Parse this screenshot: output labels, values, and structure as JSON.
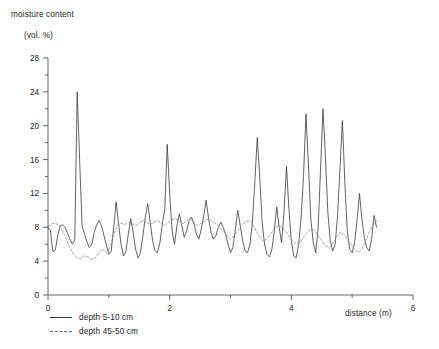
{
  "chart_data": {
    "type": "line",
    "title": "moisture content (vol. %)",
    "title_line1": "moisture content",
    "title_line2": "(vol. %)",
    "xlabel": "distance (m)",
    "ylabel": "moisture content (vol. %)",
    "xlim": [
      0,
      6
    ],
    "ylim": [
      0,
      28
    ],
    "xticks": [
      0,
      1,
      2,
      3,
      4,
      5,
      6
    ],
    "xtick_labels": [
      "0",
      "",
      "2",
      "",
      "4",
      "",
      "6"
    ],
    "yticks": [
      0,
      2,
      4,
      6,
      8,
      10,
      12,
      14,
      16,
      18,
      20,
      22,
      24,
      26,
      28
    ],
    "ytick_labels": [
      "0",
      "",
      "4",
      "",
      "8",
      "",
      "12",
      "",
      "16",
      "",
      "20",
      "",
      "24",
      "",
      "28"
    ],
    "grid": false,
    "legend_position": "below-axis-left",
    "series": [
      {
        "name": "depth 5-10 cm",
        "style": "solid",
        "color": "#3a3a3a",
        "x": [
          0.0,
          0.04,
          0.08,
          0.12,
          0.16,
          0.2,
          0.24,
          0.28,
          0.32,
          0.36,
          0.4,
          0.44,
          0.48,
          0.52,
          0.56,
          0.6,
          0.64,
          0.68,
          0.72,
          0.76,
          0.8,
          0.84,
          0.88,
          0.92,
          0.96,
          1.0,
          1.04,
          1.08,
          1.12,
          1.16,
          1.2,
          1.24,
          1.28,
          1.32,
          1.36,
          1.4,
          1.44,
          1.48,
          1.52,
          1.56,
          1.6,
          1.64,
          1.68,
          1.72,
          1.76,
          1.8,
          1.84,
          1.88,
          1.92,
          1.96,
          2.0,
          2.04,
          2.08,
          2.12,
          2.16,
          2.2,
          2.24,
          2.28,
          2.32,
          2.36,
          2.4,
          2.44,
          2.48,
          2.52,
          2.56,
          2.6,
          2.64,
          2.68,
          2.72,
          2.76,
          2.8,
          2.84,
          2.88,
          2.92,
          2.96,
          3.0,
          3.04,
          3.08,
          3.12,
          3.16,
          3.2,
          3.24,
          3.28,
          3.32,
          3.36,
          3.4,
          3.44,
          3.48,
          3.52,
          3.56,
          3.6,
          3.64,
          3.68,
          3.72,
          3.76,
          3.8,
          3.84,
          3.88,
          3.92,
          3.96,
          4.0,
          4.04,
          4.08,
          4.12,
          4.16,
          4.2,
          4.24,
          4.28,
          4.32,
          4.36,
          4.4,
          4.44,
          4.48,
          4.52,
          4.56,
          4.6,
          4.64,
          4.68,
          4.72,
          4.76,
          4.8,
          4.84,
          4.88,
          4.92,
          4.96,
          5.0,
          5.04,
          5.08,
          5.12,
          5.16,
          5.2,
          5.24,
          5.28,
          5.32,
          5.36,
          5.4
        ],
        "y": [
          8.0,
          7.6,
          5.1,
          5.3,
          7.0,
          8.2,
          8.3,
          8.0,
          7.3,
          6.6,
          6.0,
          6.5,
          24.0,
          16.0,
          8.2,
          7.2,
          6.3,
          5.6,
          6.0,
          7.4,
          8.3,
          8.8,
          8.2,
          7.0,
          5.9,
          4.8,
          5.2,
          8.0,
          11.0,
          8.4,
          6.0,
          4.6,
          5.1,
          7.2,
          9.0,
          7.4,
          5.4,
          4.4,
          5.0,
          7.0,
          9.2,
          10.8,
          8.6,
          6.4,
          5.2,
          5.0,
          6.2,
          8.4,
          10.2,
          17.8,
          12.0,
          7.6,
          6.0,
          8.2,
          9.6,
          8.2,
          6.8,
          7.6,
          8.8,
          9.2,
          8.4,
          7.2,
          6.6,
          7.8,
          9.4,
          11.2,
          9.0,
          7.4,
          6.6,
          7.0,
          8.0,
          8.6,
          8.0,
          7.2,
          6.0,
          5.0,
          5.6,
          7.8,
          10.0,
          8.2,
          6.4,
          5.2,
          5.0,
          6.0,
          8.6,
          13.4,
          18.6,
          14.0,
          8.6,
          6.0,
          4.8,
          4.5,
          5.4,
          7.6,
          10.4,
          8.0,
          6.2,
          9.8,
          15.2,
          10.2,
          6.4,
          4.6,
          4.4,
          6.0,
          9.0,
          14.0,
          21.4,
          15.6,
          9.0,
          6.2,
          5.0,
          7.8,
          14.8,
          22.0,
          16.4,
          9.8,
          6.4,
          5.2,
          6.0,
          9.4,
          15.0,
          20.6,
          13.2,
          7.6,
          5.4,
          5.0,
          6.2,
          8.8,
          12.0,
          9.0,
          6.8,
          5.6,
          5.2,
          6.6,
          9.4,
          8.0
        ]
      },
      {
        "name": "depth 45-50 cm",
        "style": "dashed",
        "color": "#8a8a8a",
        "x": [
          0.0,
          0.06,
          0.12,
          0.18,
          0.24,
          0.3,
          0.36,
          0.42,
          0.48,
          0.54,
          0.6,
          0.66,
          0.72,
          0.78,
          0.84,
          0.9,
          0.96,
          1.02,
          1.08,
          1.14,
          1.2,
          1.26,
          1.32,
          1.38,
          1.44,
          1.5,
          1.56,
          1.62,
          1.68,
          1.74,
          1.8,
          1.86,
          1.92,
          1.98,
          2.04,
          2.1,
          2.16,
          2.22,
          2.28,
          2.34,
          2.4,
          2.46,
          2.52,
          2.58,
          2.64,
          2.7,
          2.76,
          2.82,
          2.88,
          2.94,
          3.0,
          3.06,
          3.12,
          3.18,
          3.24,
          3.3,
          3.36,
          3.42,
          3.48,
          3.54,
          3.6,
          3.66,
          3.72,
          3.78,
          3.84,
          3.9,
          3.96,
          4.02,
          4.08,
          4.14,
          4.2,
          4.26,
          4.32,
          4.38,
          4.44,
          4.5,
          4.56,
          4.62,
          4.68,
          4.74,
          4.8,
          4.86,
          4.92,
          4.98,
          5.04,
          5.1,
          5.16,
          5.22,
          5.28,
          5.34,
          5.4
        ],
        "y": [
          8.1,
          8.4,
          8.5,
          8.2,
          7.6,
          6.6,
          5.6,
          4.8,
          4.4,
          4.3,
          4.6,
          4.5,
          4.2,
          4.4,
          5.0,
          5.4,
          5.0,
          5.6,
          7.2,
          8.2,
          8.5,
          8.3,
          8.6,
          8.4,
          8.2,
          8.5,
          8.8,
          8.6,
          8.3,
          8.6,
          8.8,
          8.5,
          8.2,
          8.6,
          8.9,
          9.0,
          8.7,
          8.4,
          8.8,
          9.0,
          8.6,
          8.2,
          8.5,
          8.8,
          9.0,
          8.7,
          8.4,
          8.0,
          7.6,
          7.0,
          6.6,
          7.0,
          7.6,
          8.2,
          8.6,
          8.8,
          8.4,
          7.6,
          6.8,
          6.4,
          6.6,
          7.2,
          7.8,
          8.2,
          8.0,
          7.6,
          7.0,
          6.4,
          6.0,
          6.2,
          6.8,
          7.4,
          7.8,
          7.6,
          7.0,
          6.4,
          5.8,
          5.6,
          6.0,
          6.8,
          7.4,
          7.2,
          6.6,
          6.0,
          5.4,
          5.0,
          5.4,
          6.4,
          7.4,
          8.2,
          8.8
        ]
      }
    ]
  },
  "legend": {
    "items": [
      {
        "label": "depth 5-10 cm",
        "style": "solid"
      },
      {
        "label": "depth 45-50 cm",
        "style": "dashed"
      }
    ]
  }
}
